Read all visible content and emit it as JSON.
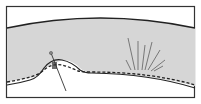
{
  "diagram": {
    "title": "",
    "colors": {
      "background": "#ffffff",
      "band_fill": "#d9d9d9",
      "outline": "#222222",
      "radiating_lines": "#777777"
    },
    "elements": {
      "outer_frame": "rectangle-border",
      "band": "curved-shaded-band",
      "dashed_line": "dashed-inner-contour",
      "bump": "raised-bump-left",
      "pin": "needle-piercing-bump",
      "fan_lines": "radiating-lines-right"
    }
  }
}
